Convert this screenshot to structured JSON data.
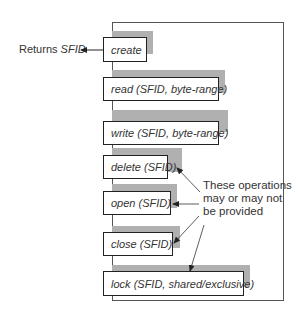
{
  "diagram": {
    "returns_label": {
      "prefix": "Returns ",
      "value": "SFID"
    },
    "operations": [
      {
        "name": "create",
        "args": ""
      },
      {
        "name": "read",
        "args": "(SFID, byte-range)"
      },
      {
        "name": "write",
        "args": "(SFID, byte-range)"
      },
      {
        "name": "delete",
        "args": "(SFID)"
      },
      {
        "name": "open",
        "args": "(SFID)"
      },
      {
        "name": "close",
        "args": "(SFID)"
      },
      {
        "name": "lock",
        "args": "(SFID, shared/exclusive)"
      }
    ],
    "annotation": {
      "line1": "These operations",
      "line2": "may or may not",
      "line3": "be provided"
    },
    "colors": {
      "shadow": "#b0b0b0",
      "border": "#222222",
      "frame": "#555555"
    }
  }
}
